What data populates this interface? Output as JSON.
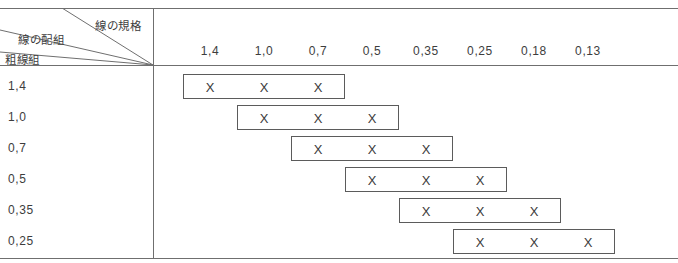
{
  "table": {
    "corner": {
      "spec_label": "線の規格",
      "combination_label": "線の配組",
      "thick_group_label": "粗線組"
    },
    "column_headers": [
      "1,4",
      "1,0",
      "0,7",
      "0,5",
      "0,35",
      "0,25",
      "0,18",
      "0,13"
    ],
    "row_headers": [
      "1,4",
      "1,0",
      "0,7",
      "0,5",
      "0,35",
      "0,25"
    ],
    "cell_mark": "X",
    "rows": [
      {
        "label": "1,4",
        "start_column": 0,
        "span": 3,
        "marks": [
          "X",
          "X",
          "X"
        ]
      },
      {
        "label": "1,0",
        "start_column": 1,
        "span": 3,
        "marks": [
          "X",
          "X",
          "X"
        ]
      },
      {
        "label": "0,7",
        "start_column": 2,
        "span": 3,
        "marks": [
          "X",
          "X",
          "X"
        ]
      },
      {
        "label": "0,5",
        "start_column": 3,
        "span": 3,
        "marks": [
          "X",
          "X",
          "X"
        ]
      },
      {
        "label": "0,35",
        "start_column": 4,
        "span": 3,
        "marks": [
          "X",
          "X",
          "X"
        ]
      },
      {
        "label": "0,25",
        "start_column": 5,
        "span": 3,
        "marks": [
          "X",
          "X",
          "X"
        ]
      }
    ],
    "colors": {
      "rule": "#6f6f6f",
      "box_border": "#5b5b5b",
      "text": "#3d3d3d",
      "background": "#ffffff"
    }
  }
}
